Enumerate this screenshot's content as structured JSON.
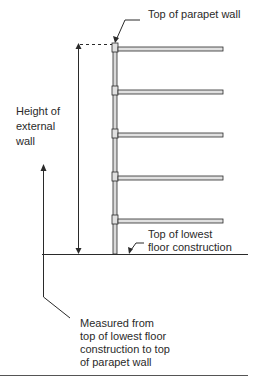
{
  "diagram": {
    "labels": {
      "top_parapet": "Top of parapet wall",
      "height_external_wall": "Height of\nexternal\nwall",
      "top_lowest_floor": "Top of lowest\nfloor construction",
      "measured_note": "Measured from\ntop of lowest floor\nconstruction to top\nof parapet wall"
    },
    "floors": 5,
    "colors": {
      "line": "#2a2a2a",
      "wall_fill": "#d9d9d9",
      "slab_fill": "#e0e0e0"
    }
  }
}
